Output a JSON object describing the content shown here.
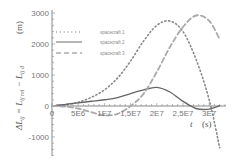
{
  "chart_data": {
    "type": "line",
    "title": "",
    "xlabel": "t (s)",
    "ylabel": "ΔL_ij = L_ij rel − L_ij d (m)",
    "xlim": [
      0,
      32000000.0
    ],
    "ylim": [
      -1600,
      3100
    ],
    "grid": false,
    "legend_position": "upper-left",
    "x_ticks": [
      0,
      5000000.0,
      10000000.0,
      15000000.0,
      20000000.0,
      25000000.0,
      30000000.0
    ],
    "x_tick_labels": [
      "0",
      "5E6",
      "1E7",
      "1,5E7",
      "2E7",
      "2,5E7",
      "3E7"
    ],
    "y_ticks": [
      -1000,
      0,
      1000,
      2000,
      3000
    ],
    "y_tick_labels": [
      "-1000",
      "0",
      "1000",
      "2000",
      "3000"
    ],
    "series": [
      {
        "name": "spacecraft 1",
        "style": "dotted",
        "color": "#888888",
        "x": [
          0,
          2500000.0,
          5000000.0,
          7500000.0,
          10000000.0,
          12500000.0,
          15000000.0,
          17500000.0,
          20000000.0,
          22500000.0,
          25000000.0,
          27500000.0,
          30000000.0,
          32000000.0
        ],
        "values": [
          0,
          40,
          120,
          280,
          520,
          900,
          1450,
          2100,
          2600,
          2740,
          2400,
          1500,
          200,
          -1350
        ]
      },
      {
        "name": "spacecraft 2",
        "style": "solid",
        "color": "#666666",
        "x": [
          0,
          2500000.0,
          5000000.0,
          7500000.0,
          10000000.0,
          12500000.0,
          15000000.0,
          17500000.0,
          20000000.0,
          22500000.0,
          25000000.0,
          27500000.0,
          30000000.0,
          32000000.0
        ],
        "values": [
          0,
          50,
          100,
          150,
          200,
          270,
          400,
          520,
          600,
          450,
          150,
          -80,
          -100,
          10
        ]
      },
      {
        "name": "spacecraft 3",
        "style": "dashed",
        "color": "#aaaaaa",
        "x": [
          0,
          2500000.0,
          5000000.0,
          7500000.0,
          10000000.0,
          12500000.0,
          15000000.0,
          17500000.0,
          20000000.0,
          22500000.0,
          25000000.0,
          27500000.0,
          30000000.0,
          32000000.0
        ],
        "values": [
          0,
          -20,
          -80,
          -200,
          -300,
          -250,
          0,
          400,
          1100,
          1900,
          2550,
          2920,
          2750,
          2150
        ]
      }
    ]
  },
  "labels": {
    "y_axis_math": "ΔL",
    "y_axis_rest": " = L",
    "y_axis_unit": "(m)",
    "x_axis_var": "t",
    "x_axis_unit": "(s)"
  }
}
